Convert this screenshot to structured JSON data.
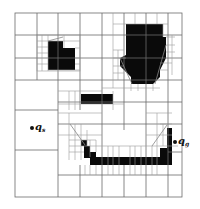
{
  "diagram": {
    "type": "quadtree-decomposition",
    "colors": {
      "obstacle": "#0a0a0a",
      "grid": "#6b6b6b",
      "fine_grid": "#9a9a9a",
      "background": "#ffffff",
      "path": "#888888"
    },
    "start": {
      "symbol": "q",
      "subscript": "s"
    },
    "goal": {
      "symbol": "q",
      "subscript": "g"
    }
  }
}
